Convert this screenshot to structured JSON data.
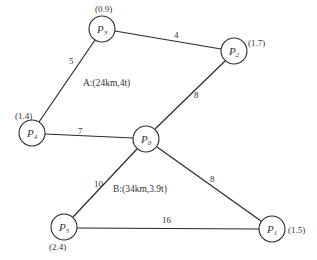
{
  "diagram": {
    "type": "weighted-graph",
    "nodes": [
      {
        "id": "P0",
        "label": "P",
        "sub": "0",
        "demand": "",
        "cx": 146,
        "cy": 139
      },
      {
        "id": "P1",
        "label": "P",
        "sub": "1",
        "demand": "(1.5)",
        "cx": 272,
        "cy": 229,
        "dx": 304,
        "dy": 233
      },
      {
        "id": "P2",
        "label": "P",
        "sub": "2",
        "demand": "(1.7)",
        "cx": 234,
        "cy": 51,
        "dx": 260,
        "dy": 46
      },
      {
        "id": "P3",
        "label": "P",
        "sub": "3",
        "demand": "(0.9)",
        "cx": 102,
        "cy": 29,
        "dx": 107,
        "dy": 11
      },
      {
        "id": "P4",
        "label": "P",
        "sub": "4",
        "demand": "(1.4)",
        "cx": 32,
        "cy": 133,
        "dx": 22,
        "dy": 118
      },
      {
        "id": "P5",
        "label": "P",
        "sub": "5",
        "demand": "(2.4)",
        "cx": 64,
        "cy": 227,
        "dx": 60,
        "dy": 248
      }
    ],
    "edges": [
      {
        "from": "P3",
        "to": "P2",
        "weight": "4",
        "lx": 176,
        "ly": 36
      },
      {
        "from": "P3",
        "to": "P4",
        "weight": "5",
        "lx": 69,
        "ly": 63
      },
      {
        "from": "P2",
        "to": "P0",
        "weight": "8",
        "lx": 194,
        "ly": 97
      },
      {
        "from": "P4",
        "to": "P0",
        "weight": "7",
        "lx": 80,
        "ly": 132
      },
      {
        "from": "P0",
        "to": "P5",
        "weight": "10",
        "lx": 95,
        "ly": 187
      },
      {
        "from": "P0",
        "to": "P1",
        "weight": "8",
        "lx": 211,
        "ly": 182
      },
      {
        "from": "P5",
        "to": "P1",
        "weight": "16",
        "lx": 165,
        "ly": 223
      }
    ],
    "route_labels": [
      {
        "text": "A:(24km,4t)",
        "x": 83,
        "y": 85
      },
      {
        "text": "B:(34km,3.9t)",
        "x": 113,
        "y": 192
      }
    ],
    "node_radius": 13
  },
  "labels": {
    "n0": "P",
    "n0s": "0",
    "n1": "P",
    "n1s": "1",
    "d1": "(1.5)",
    "n2": "P",
    "n2s": "2",
    "d2": "(1.7)",
    "n3": "P",
    "n3s": "3",
    "d3": "(0.9)",
    "n4": "P",
    "n4s": "4",
    "d4": "(1.4)",
    "n5": "P",
    "n5s": "5",
    "d5": "(2.4)",
    "w_p3_p2": "4",
    "w_p3_p4": "5",
    "w_p2_p0": "8",
    "w_p4_p0": "7",
    "w_p0_p5": "10",
    "w_p0_p1": "8",
    "w_p5_p1": "16",
    "route_a": "A:(24km,4t)",
    "route_b": "B:(34km,3.9t)"
  }
}
